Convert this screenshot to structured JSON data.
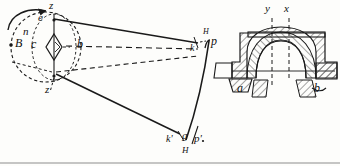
{
  "figure": {
    "background_color": "#fdfdfb",
    "ink_color": "#1a1a1a",
    "hatch_color": "#444444"
  },
  "left_diagram": {
    "name": "crank-and-link-kinematic-diagram",
    "labels": {
      "rotation_arrow": "n",
      "center_point": "B",
      "hub_label": "c",
      "top_pivot": "e",
      "top_pivot_upper": "z",
      "bottom_pivot": "z",
      "link_length": "b"
    }
  },
  "middle_diagram": {
    "name": "curved-blade-profile",
    "labels": {
      "upper_intersection": "k",
      "upper_small": "H",
      "upper_right": "p",
      "lower_left": "k'",
      "lower_center": "g",
      "lower_right": "p'",
      "lower_bottom": "H"
    }
  },
  "right_diagram": {
    "name": "bearing-housing-cross-section",
    "labels": {
      "axis_left": "y",
      "axis_right": "x",
      "part_left": "a",
      "part_right": "b"
    }
  }
}
